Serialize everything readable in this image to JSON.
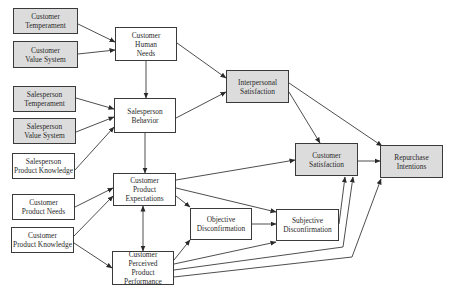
{
  "diagram": {
    "colors": {
      "gray_fill": "#dcdcdc",
      "white_fill": "#ffffff",
      "stroke": "#3a3a3a",
      "text": "#2a2a2a"
    },
    "nodes": [
      {
        "id": "customer-temperament",
        "label": "Customer\nTemperament",
        "fill": "gray",
        "x": 13,
        "y": 8,
        "w": 65,
        "h": 26
      },
      {
        "id": "customer-value-system",
        "label": "Customer\nValue System",
        "fill": "gray",
        "x": 13,
        "y": 41,
        "w": 65,
        "h": 27
      },
      {
        "id": "customer-human-needs",
        "label": "Customer\nHuman\nNeeds",
        "fill": "white",
        "x": 115,
        "y": 27,
        "w": 62,
        "h": 34
      },
      {
        "id": "interpersonal-satisfaction",
        "label": "Interpersonal\nSatisfaction",
        "fill": "gray",
        "x": 226,
        "y": 70,
        "w": 63,
        "h": 33
      },
      {
        "id": "salesperson-temperament",
        "label": "Salesperson\nTemperament",
        "fill": "gray",
        "x": 13,
        "y": 86,
        "w": 63,
        "h": 26
      },
      {
        "id": "salesperson-value-system",
        "label": "Salesperson\nValue System",
        "fill": "gray",
        "x": 13,
        "y": 118,
        "w": 63,
        "h": 26
      },
      {
        "id": "salesperson-behavior",
        "label": "Salesperson\nBehavior",
        "fill": "white",
        "x": 114,
        "y": 98,
        "w": 62,
        "h": 35
      },
      {
        "id": "salesperson-product-knowledge",
        "label": "Salesperson\nProduct Knowledge",
        "fill": "white",
        "x": 12,
        "y": 153,
        "w": 63,
        "h": 26
      },
      {
        "id": "customer-satisfaction",
        "label": "Customer\nSatisfaction",
        "fill": "gray",
        "x": 295,
        "y": 143,
        "w": 63,
        "h": 33
      },
      {
        "id": "repurchase-intentions",
        "label": "Repurchase\nIntentions",
        "fill": "gray",
        "x": 380,
        "y": 145,
        "w": 63,
        "h": 33
      },
      {
        "id": "customer-product-expectations",
        "label": "Customer\nProduct\nExpectations",
        "fill": "white",
        "x": 113,
        "y": 173,
        "w": 63,
        "h": 33
      },
      {
        "id": "customer-product-needs",
        "label": "Customer\nProduct Needs",
        "fill": "white",
        "x": 12,
        "y": 194,
        "w": 63,
        "h": 26
      },
      {
        "id": "objective-disconfirmation",
        "label": "Objective\nDisconfirmation",
        "fill": "white",
        "x": 190,
        "y": 208,
        "w": 62,
        "h": 32
      },
      {
        "id": "subjective-disconfirmation",
        "label": "Subjective\nDisconfirmation",
        "fill": "white",
        "x": 276,
        "y": 209,
        "w": 63,
        "h": 32
      },
      {
        "id": "customer-product-knowledge",
        "label": "Customer\nProduct Knowledge",
        "fill": "white",
        "x": 11,
        "y": 227,
        "w": 63,
        "h": 26
      },
      {
        "id": "customer-perceived-product-performance",
        "label": "Customer Perceived\nProduct\nPerformance",
        "fill": "white",
        "x": 112,
        "y": 251,
        "w": 62,
        "h": 34
      }
    ],
    "edges": [
      {
        "from": "customer-temperament",
        "to": "customer-human-needs",
        "points": [
          [
            78,
            24
          ],
          [
            115,
            42
          ]
        ]
      },
      {
        "from": "customer-value-system",
        "to": "customer-human-needs",
        "points": [
          [
            78,
            54
          ],
          [
            115,
            50
          ]
        ]
      },
      {
        "from": "customer-human-needs",
        "to": "salesperson-behavior",
        "points": [
          [
            146,
            61
          ],
          [
            146,
            98
          ]
        ]
      },
      {
        "from": "customer-human-needs",
        "to": "interpersonal-satisfaction",
        "points": [
          [
            177,
            43
          ],
          [
            226,
            78
          ]
        ]
      },
      {
        "from": "salesperson-behavior",
        "to": "interpersonal-satisfaction",
        "points": [
          [
            176,
            118
          ],
          [
            226,
            92
          ]
        ]
      },
      {
        "from": "salesperson-temperament",
        "to": "salesperson-behavior",
        "points": [
          [
            76,
            98
          ],
          [
            114,
            109
          ]
        ]
      },
      {
        "from": "salesperson-value-system",
        "to": "salesperson-behavior",
        "points": [
          [
            76,
            132
          ],
          [
            114,
            117
          ]
        ]
      },
      {
        "from": "salesperson-product-knowledge",
        "to": "salesperson-behavior",
        "points": [
          [
            75,
            170
          ],
          [
            114,
            127
          ]
        ]
      },
      {
        "from": "salesperson-behavior",
        "to": "customer-product-expectations",
        "points": [
          [
            145,
            133
          ],
          [
            145,
            173
          ]
        ]
      },
      {
        "from": "interpersonal-satisfaction",
        "to": "customer-satisfaction",
        "points": [
          [
            289,
            92
          ],
          [
            320,
            143
          ]
        ]
      },
      {
        "from": "interpersonal-satisfaction",
        "to": "repurchase-intentions",
        "points": [
          [
            289,
            83
          ],
          [
            382,
            146
          ]
        ]
      },
      {
        "from": "customer-satisfaction",
        "to": "repurchase-intentions",
        "points": [
          [
            358,
            161
          ],
          [
            380,
            161
          ]
        ]
      },
      {
        "from": "customer-product-expectations",
        "to": "customer-satisfaction",
        "points": [
          [
            176,
            180
          ],
          [
            295,
            160
          ]
        ]
      },
      {
        "from": "customer-product-expectations",
        "to": "objective-disconfirmation",
        "points": [
          [
            176,
            196
          ],
          [
            190,
            207
          ]
        ]
      },
      {
        "from": "customer-product-expectations",
        "to": "subjective-disconfirmation",
        "points": [
          [
            176,
            188
          ],
          [
            276,
            212
          ]
        ]
      },
      {
        "from": "customer-product-needs",
        "to": "customer-product-expectations",
        "points": [
          [
            75,
            207
          ],
          [
            113,
            188
          ]
        ]
      },
      {
        "from": "customer-product-knowledge",
        "to": "customer-product-expectations",
        "points": [
          [
            74,
            236
          ],
          [
            113,
            196
          ]
        ]
      },
      {
        "from": "customer-product-knowledge",
        "to": "customer-perceived-product-performance",
        "points": [
          [
            74,
            243
          ],
          [
            112,
            268
          ]
        ]
      },
      {
        "from": "customer-product-expectations",
        "to": "customer-perceived-product-performance",
        "points": [
          [
            143,
            206
          ],
          [
            143,
            251
          ]
        ],
        "bidirectional": true
      },
      {
        "from": "objective-disconfirmation",
        "to": "subjective-disconfirmation",
        "points": [
          [
            252,
            224
          ],
          [
            276,
            224
          ]
        ]
      },
      {
        "from": "customer-perceived-product-performance",
        "to": "objective-disconfirmation",
        "points": [
          [
            174,
            260
          ],
          [
            190,
            240
          ]
        ]
      },
      {
        "from": "customer-perceived-product-performance",
        "to": "subjective-disconfirmation",
        "points": [
          [
            174,
            264
          ],
          [
            276,
            242
          ]
        ]
      },
      {
        "from": "subjective-disconfirmation",
        "to": "customer-satisfaction",
        "points": [
          [
            339,
            224
          ],
          [
            345,
            177
          ]
        ]
      },
      {
        "from": "customer-perceived-product-performance",
        "to": "customer-satisfaction",
        "points": [
          [
            174,
            270
          ],
          [
            343,
            247
          ],
          [
            353,
            177
          ]
        ]
      },
      {
        "from": "customer-perceived-product-performance",
        "to": "repurchase-intentions",
        "points": [
          [
            174,
            277
          ],
          [
            352,
            257
          ],
          [
            381,
            179
          ]
        ]
      }
    ]
  }
}
